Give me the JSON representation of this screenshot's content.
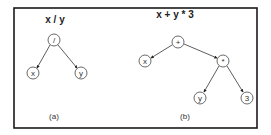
{
  "figure": {
    "panels": [
      {
        "id": "a",
        "title": "x / y",
        "caption": "(a)",
        "nodes": [
          {
            "id": "div",
            "label": "/",
            "x": 54,
            "y": 40
          },
          {
            "id": "x",
            "label": "x",
            "x": 33,
            "y": 73
          },
          {
            "id": "y",
            "label": "y",
            "x": 81,
            "y": 73
          }
        ],
        "edges": [
          {
            "from": "div",
            "to": "x"
          },
          {
            "from": "div",
            "to": "y"
          }
        ]
      },
      {
        "id": "b",
        "title": "x + y * 3",
        "caption": "(b)",
        "nodes": [
          {
            "id": "plus",
            "label": "+",
            "x": 178,
            "y": 42
          },
          {
            "id": "x",
            "label": "x",
            "x": 145,
            "y": 61
          },
          {
            "id": "mul",
            "label": "*",
            "x": 223,
            "y": 61
          },
          {
            "id": "y",
            "label": "y",
            "x": 200,
            "y": 98
          },
          {
            "id": "three",
            "label": "3",
            "x": 247,
            "y": 98
          }
        ],
        "edges": [
          {
            "from": "plus",
            "to": "x"
          },
          {
            "from": "plus",
            "to": "mul"
          },
          {
            "from": "mul",
            "to": "y"
          },
          {
            "from": "mul",
            "to": "three"
          }
        ]
      }
    ],
    "colors": {
      "frame": "#1a1a1a",
      "edge": "#333333",
      "node_stroke": "#444444",
      "text": "#333333"
    }
  }
}
